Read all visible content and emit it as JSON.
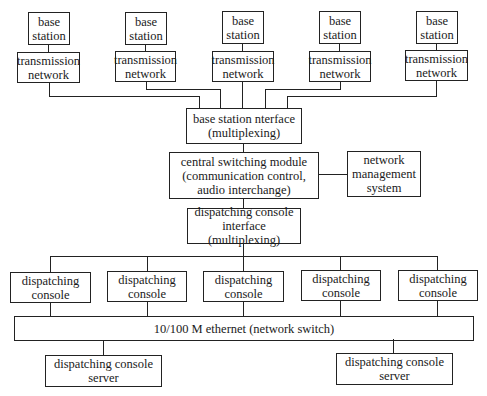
{
  "diagram": {
    "base_stations": [
      {
        "label": "base\nstation"
      },
      {
        "label": "base\nstation"
      },
      {
        "label": "base\nstation"
      },
      {
        "label": "base\nstation"
      },
      {
        "label": "base\nstation"
      }
    ],
    "transmission_networks": [
      {
        "label": "transmission\nnetwork"
      },
      {
        "label": "transmission\nnetwork"
      },
      {
        "label": "transmission\nnetwork"
      },
      {
        "label": "transmission\nnetwork"
      },
      {
        "label": "transmission\nnetwork"
      }
    ],
    "base_station_interface": {
      "label": "base station nterface\n(multiplexing)"
    },
    "central_switching_module": {
      "label": "central switching module\n(communication control,\naudio interchange)"
    },
    "network_management_system": {
      "label": "network\nmanagement\nsystem"
    },
    "dispatching_console_interface": {
      "label": "dispatching console\ninterface (multiplexing)"
    },
    "dispatching_consoles": [
      {
        "label": "dispatching\nconsole"
      },
      {
        "label": "dispatching\nconsole"
      },
      {
        "label": "dispatching\nconsole"
      },
      {
        "label": "dispatching\nconsole"
      },
      {
        "label": "dispatching\nconsole"
      }
    ],
    "ethernet": {
      "label": "10/100 M ethernet (network switch)"
    },
    "servers": [
      {
        "label": "dispatching console\nserver"
      },
      {
        "label": "dispatching console\nserver"
      }
    ]
  }
}
